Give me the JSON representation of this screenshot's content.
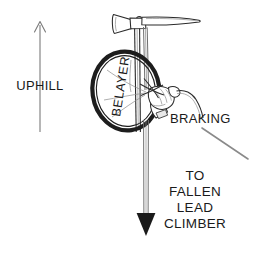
{
  "figure": {
    "background_color": "#ffffff",
    "ink_color": "#1d1d1d",
    "width": 262,
    "height": 253
  },
  "labels": {
    "uphill": "UPHILL",
    "braking": "BRAKING",
    "belayer": "BELAYER",
    "target_line_1": "TO",
    "target_line_2": "FALLEN",
    "target_line_3": "LEAD",
    "target_line_4": "CLIMBER"
  },
  "annotations": {
    "uphill_arrow": {
      "direction": "up",
      "icon": "arrow-up-icon",
      "x": 40,
      "y_top": 22,
      "y_bottom": 132
    },
    "load_arrow": {
      "direction": "down",
      "icon": "arrow-down-icon",
      "x": 146,
      "y_top": 120,
      "y_bottom": 236
    },
    "braking_leader": {
      "icon": "leader-line-icon",
      "from_x": 202,
      "from_y": 128,
      "to_x": 248,
      "to_y": 159
    }
  },
  "objects": {
    "ice_axe": {
      "icon": "ice-axe-icon",
      "parts": [
        "adze",
        "pick",
        "shaft"
      ]
    },
    "belayer_oval": {
      "icon": "ellipse-outline-icon",
      "center_x": 126,
      "center_y": 91,
      "radius_x": 33,
      "radius_y": 39,
      "rotation_deg": -8
    },
    "gloved_hand": {
      "icon": "gloved-hand-icon"
    },
    "rope": {
      "icon": "rope-icon",
      "strands": 2
    }
  }
}
